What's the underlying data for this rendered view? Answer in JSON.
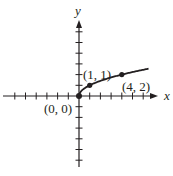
{
  "chart_data": {
    "type": "line",
    "title": "",
    "function": "y = sqrt(x)",
    "xlabel": "x",
    "ylabel": "y",
    "xlim": [
      -7,
      7
    ],
    "ylim": [
      -6,
      7
    ],
    "grid": false,
    "tick_spacing": 1,
    "series": [
      {
        "name": "y = √x",
        "x": [
          0,
          0.25,
          0.5,
          1,
          1.5,
          2,
          2.5,
          3,
          3.5,
          4,
          4.5,
          5,
          5.5,
          6,
          6.5
        ],
        "values": [
          0,
          0.5,
          0.707,
          1,
          1.225,
          1.414,
          1.581,
          1.732,
          1.871,
          2,
          2.121,
          2.236,
          2.345,
          2.449,
          2.55
        ]
      }
    ],
    "points": [
      {
        "x": 0,
        "y": 0,
        "label": "(0, 0)"
      },
      {
        "x": 1,
        "y": 1,
        "label": "(1, 1)"
      },
      {
        "x": 4,
        "y": 2,
        "label": "(4, 2)"
      }
    ],
    "color": "#231f20"
  },
  "labels": {
    "x_axis": "x",
    "y_axis": "y",
    "p0": "(0, 0)",
    "p1": "(1, 1)",
    "p2": "(4, 2)"
  }
}
